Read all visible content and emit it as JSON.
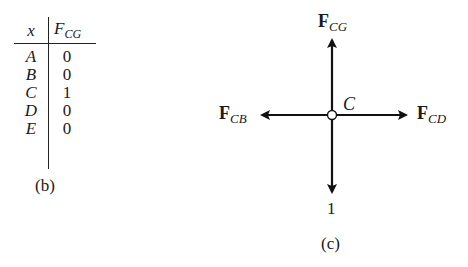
{
  "panel_b": {
    "caption": "(b)",
    "table": {
      "header_x": "x",
      "header_f_main": "F",
      "header_f_sub": "CG",
      "rows": [
        {
          "x": "A",
          "value": "0"
        },
        {
          "x": "B",
          "value": "0"
        },
        {
          "x": "C",
          "value": "1"
        },
        {
          "x": "D",
          "value": "0"
        },
        {
          "x": "E",
          "value": "0"
        }
      ]
    }
  },
  "panel_c": {
    "caption": "(c)",
    "joint_label": "C",
    "load_label": "1",
    "forces": {
      "up": {
        "main": "F",
        "sub": "CG"
      },
      "left": {
        "main": "F",
        "sub": "CB"
      },
      "right": {
        "main": "F",
        "sub": "CD"
      }
    }
  }
}
